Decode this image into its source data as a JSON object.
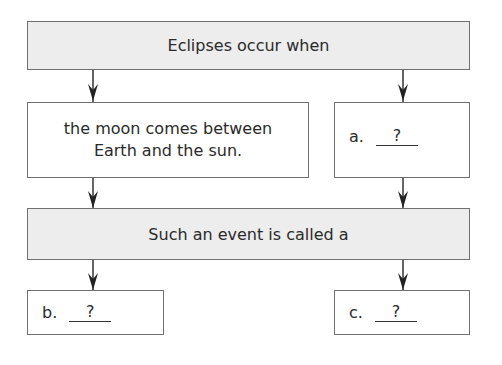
{
  "diagram": {
    "top_box": "Eclipses occur when",
    "middle_left_box": [
      "the moon comes between",
      "Earth and the sun."
    ],
    "middle_right_box": {
      "label": "a.",
      "blank": "?"
    },
    "second_box": "Such an event is called a",
    "bottom_left_box": {
      "label": "b.",
      "blank": "?"
    },
    "bottom_right_box": {
      "label": "c.",
      "blank": "?"
    },
    "colors": {
      "gray_fill": "#ededed",
      "border": "#707070",
      "arrow": "#222222"
    }
  }
}
